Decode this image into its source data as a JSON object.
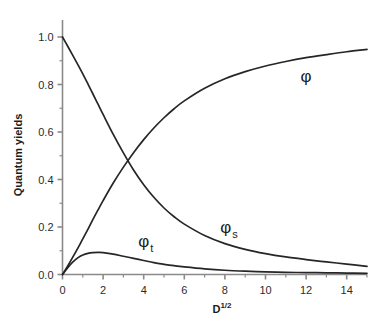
{
  "chart_data": {
    "type": "line",
    "title": "",
    "xlabel": "D",
    "xlabel_sup": "1/2",
    "ylabel": "Quantum yields",
    "xlim": [
      0,
      15
    ],
    "ylim": [
      0.0,
      1.0
    ],
    "grid": false,
    "legend_position": "inline-annotations",
    "x_ticks": [
      0,
      2,
      4,
      6,
      8,
      10,
      12,
      14
    ],
    "x_tick_labels": [
      "0",
      "2",
      "4",
      "6",
      "8",
      "10",
      "12",
      "14"
    ],
    "x_minor_ticks": [
      1,
      3,
      5,
      7,
      9,
      11,
      13,
      15
    ],
    "y_ticks": [
      0.0,
      0.2,
      0.4,
      0.6,
      0.8,
      1.0
    ],
    "y_tick_labels": [
      "0.0",
      "0.2",
      "0.4",
      "0.6",
      "0.8",
      "1.0"
    ],
    "y_minor_ticks": [
      0.1,
      0.3,
      0.5,
      0.7,
      0.9
    ],
    "x": [
      0,
      0.25,
      0.5,
      0.75,
      1,
      1.25,
      1.5,
      1.75,
      2,
      2.5,
      3,
      3.5,
      4,
      4.5,
      5,
      5.5,
      6,
      7,
      8,
      9,
      10,
      11,
      12,
      13,
      14,
      15
    ],
    "series": [
      {
        "name": "phi",
        "label": "φ",
        "label_sub": "",
        "label_x": 12,
        "label_y": 0.81,
        "color": "#262626",
        "values": [
          0.0,
          0.035,
          0.072,
          0.11,
          0.15,
          0.19,
          0.232,
          0.272,
          0.311,
          0.385,
          0.452,
          0.513,
          0.568,
          0.617,
          0.66,
          0.698,
          0.731,
          0.784,
          0.824,
          0.854,
          0.878,
          0.897,
          0.913,
          0.926,
          0.938,
          0.948
        ]
      },
      {
        "name": "phi_s",
        "label": "φ",
        "label_sub": "s",
        "label_x": 8.2,
        "label_y": 0.175,
        "color": "#262626",
        "values": [
          1.0,
          0.962,
          0.924,
          0.885,
          0.845,
          0.803,
          0.76,
          0.717,
          0.674,
          0.59,
          0.512,
          0.44,
          0.378,
          0.325,
          0.28,
          0.243,
          0.212,
          0.164,
          0.13,
          0.106,
          0.088,
          0.074,
          0.063,
          0.053,
          0.044,
          0.034
        ]
      },
      {
        "name": "phi_t",
        "label": "φ",
        "label_sub": "t",
        "label_x": 4.1,
        "label_y": 0.115,
        "color": "#262626",
        "values": [
          0.0,
          0.028,
          0.052,
          0.07,
          0.082,
          0.089,
          0.092,
          0.093,
          0.092,
          0.086,
          0.077,
          0.068,
          0.059,
          0.05,
          0.043,
          0.037,
          0.032,
          0.024,
          0.018,
          0.014,
          0.011,
          0.009,
          0.008,
          0.007,
          0.006,
          0.005
        ]
      }
    ]
  }
}
